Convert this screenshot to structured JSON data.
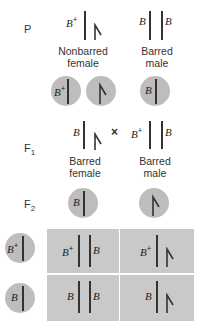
{
  "generations": {
    "p": "P",
    "f1": {
      "base": "F",
      "sub": "1"
    },
    "f2": {
      "base": "F",
      "sub": "2"
    }
  },
  "parental": {
    "female": {
      "allele": "B",
      "sup": "+",
      "caption_line1": "Nonbarred",
      "caption_line2": "female"
    },
    "male": {
      "allele_left": "B",
      "allele_right": "B",
      "caption_line1": "Barred",
      "caption_line2": "male"
    }
  },
  "parental_gametes": [
    {
      "allele": "B",
      "sup": "+",
      "chromosome": "Z"
    },
    {
      "allele": "",
      "chromosome": "W"
    },
    {
      "allele": "B",
      "chromosome": "Z"
    }
  ],
  "f1": {
    "cross_symbol": "×",
    "female": {
      "allele": "B",
      "caption_line1": "Barred",
      "caption_line2": "female"
    },
    "male": {
      "allele_left": "B",
      "sup": "+",
      "allele_right": "B",
      "caption_line1": "Barred",
      "caption_line2": "male"
    }
  },
  "f2_gametes_top": [
    {
      "allele": "B",
      "chromosome": "Z"
    },
    {
      "allele": "",
      "chromosome": "W"
    }
  ],
  "f2_gametes_side": [
    {
      "allele": "B",
      "sup": "+"
    },
    {
      "allele": "B"
    }
  ],
  "punnett": {
    "rows": [
      [
        {
          "left": "B",
          "left_sup": "+",
          "right": "B"
        },
        {
          "left": "B",
          "left_sup": "+",
          "right": "W"
        }
      ],
      [
        {
          "left": "B",
          "right": "B"
        },
        {
          "left": "B",
          "right": "W"
        }
      ]
    ]
  },
  "colors": {
    "circle_fill": "#bdbdbd",
    "grid_fill": "#c9c9c9",
    "chromosome": "#333333"
  }
}
